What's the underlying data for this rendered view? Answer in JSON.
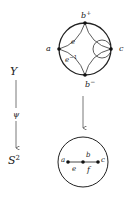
{
  "left_column": {
    "top_label": "Y",
    "map_label": "ψ",
    "bottom_label": "S",
    "bottom_label_sup": "2"
  },
  "top_circle": {
    "labels": {
      "b_plus": "b",
      "b_plus_sup": "+",
      "b_minus": "b",
      "b_minus_sup": "−",
      "a": "a",
      "c": "c",
      "e": "e",
      "e_inv": "e",
      "e_inv_sup": "−1"
    }
  },
  "bottom_circle": {
    "labels": {
      "a": "a",
      "b": "b",
      "c": "c",
      "e": "e",
      "f": "f"
    }
  }
}
